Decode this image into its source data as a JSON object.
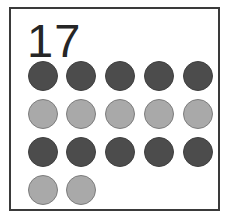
{
  "card": {
    "count_label": "17",
    "background_color": "#ffffff",
    "border_color": "#3a3a3a"
  },
  "legend": {
    "dark_color": "#4c4c4c",
    "light_color": "#a9a9a9"
  },
  "chart_data": {
    "type": "table",
    "title": "17",
    "xlabel": "",
    "ylabel": "",
    "categories": [
      "Row 1",
      "Row 2",
      "Row 3",
      "Row 4"
    ],
    "values": [
      5,
      5,
      5,
      2
    ],
    "total": 17,
    "series": [
      {
        "name": "dark dots",
        "values": [
          5,
          0,
          5,
          0
        ]
      },
      {
        "name": "light dots",
        "values": [
          0,
          5,
          0,
          2
        ]
      }
    ],
    "rows": [
      {
        "index": 1,
        "shade": "dark",
        "color": "#4c4c4c",
        "count": 5,
        "dots": [
          {
            "shade": "dark",
            "x": 0
          },
          {
            "shade": "dark",
            "x": 38
          },
          {
            "shade": "dark",
            "x": 77
          },
          {
            "shade": "dark",
            "x": 116
          },
          {
            "shade": "dark",
            "x": 155
          }
        ]
      },
      {
        "index": 2,
        "shade": "light",
        "color": "#a9a9a9",
        "count": 5,
        "dots": [
          {
            "shade": "light",
            "x": 0
          },
          {
            "shade": "light",
            "x": 38
          },
          {
            "shade": "light",
            "x": 77
          },
          {
            "shade": "light",
            "x": 116
          },
          {
            "shade": "light",
            "x": 155
          }
        ]
      },
      {
        "index": 3,
        "shade": "dark",
        "color": "#4c4c4c",
        "count": 5,
        "dots": [
          {
            "shade": "dark",
            "x": 0
          },
          {
            "shade": "dark",
            "x": 38
          },
          {
            "shade": "dark",
            "x": 77
          },
          {
            "shade": "dark",
            "x": 116
          },
          {
            "shade": "dark",
            "x": 155
          }
        ]
      },
      {
        "index": 4,
        "shade": "light",
        "color": "#a9a9a9",
        "count": 2,
        "dots": [
          {
            "shade": "light",
            "x": 0
          },
          {
            "shade": "light",
            "x": 38
          }
        ]
      }
    ]
  }
}
